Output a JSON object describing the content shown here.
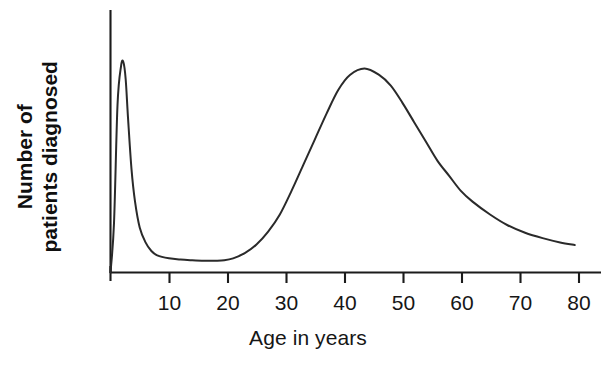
{
  "chart_data": {
    "type": "line",
    "title": "",
    "subtitle": "",
    "xlabel": "Age in years",
    "ylabel": "Number of patients diagnosed",
    "ylabel_lines": [
      "Number of",
      "patients diagnosed"
    ],
    "xlim": [
      0,
      84
    ],
    "ylim": [
      0,
      1.05
    ],
    "grid": false,
    "legend": null,
    "axis_color": "#1b1b1b",
    "line_color": "#2a2a2a",
    "background_color": "#ffffff",
    "x_ticks": [
      0,
      10,
      20,
      30,
      40,
      50,
      60,
      70,
      80
    ],
    "x_tick_labels": [
      "",
      "10",
      "20",
      "30",
      "40",
      "50",
      "60",
      "70",
      "80"
    ],
    "y_ticks": [],
    "y_tick_labels": [],
    "series": [
      {
        "name": "Number of patients diagnosed",
        "x": [
          0,
          0.6,
          1.2,
          1.8,
          2.2,
          2.6,
          3.0,
          3.6,
          4.2,
          5.0,
          6.0,
          7.0,
          8.0,
          10.0,
          12.0,
          14.0,
          16.0,
          18.0,
          19.5,
          21.0,
          23.0,
          25.0,
          27.0,
          29.0,
          31.0,
          33.0,
          35.0,
          37.0,
          39.0,
          41.0,
          43.5,
          46.0,
          48.0,
          50.0,
          52.0,
          54.0,
          56.0,
          58.0,
          60.0,
          62.0,
          65.0,
          68.0,
          71.0,
          74.0,
          77.0,
          79.5
        ],
        "y": [
          0.0,
          0.23,
          0.78,
          0.96,
          0.98,
          0.9,
          0.72,
          0.48,
          0.33,
          0.21,
          0.14,
          0.1,
          0.08,
          0.066,
          0.06,
          0.057,
          0.055,
          0.055,
          0.057,
          0.066,
          0.09,
          0.13,
          0.19,
          0.27,
          0.38,
          0.5,
          0.62,
          0.74,
          0.85,
          0.92,
          0.95,
          0.92,
          0.87,
          0.79,
          0.7,
          0.61,
          0.52,
          0.45,
          0.38,
          0.33,
          0.27,
          0.22,
          0.185,
          0.16,
          0.14,
          0.128
        ]
      }
    ],
    "peaks": [
      {
        "label": "infantile peak",
        "age": 2.2,
        "relative_height": 0.98
      },
      {
        "label": "adult peak",
        "age": 43.5,
        "relative_height": 0.95
      }
    ],
    "trough": {
      "label": "childhood trough",
      "age_range": [
        16,
        19
      ],
      "relative_height": 0.055
    }
  },
  "axis_titles": {
    "x": "Age in years",
    "y_line1": "Number of",
    "y_line2": "patients diagnosed"
  },
  "tick_labels": {
    "t10": "10",
    "t20": "20",
    "t30": "30",
    "t40": "40",
    "t50": "50",
    "t60": "60",
    "t70": "70",
    "t80": "80"
  }
}
